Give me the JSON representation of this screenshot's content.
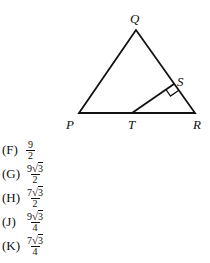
{
  "figure": {
    "labels": {
      "Q": "Q",
      "P": "P",
      "R": "R",
      "S": "S",
      "T": "T"
    },
    "stroke_color": "#111111"
  },
  "choices": [
    {
      "letter": "(F)",
      "coef": "9",
      "radical": "",
      "den": "2"
    },
    {
      "letter": "(G)",
      "coef": "9",
      "radical": "3",
      "den": "2"
    },
    {
      "letter": "(H)",
      "coef": "7",
      "radical": "3",
      "den": "2"
    },
    {
      "letter": "(J)",
      "coef": "9",
      "radical": "3",
      "den": "4"
    },
    {
      "letter": "(K)",
      "coef": "7",
      "radical": "3",
      "den": "4"
    }
  ]
}
